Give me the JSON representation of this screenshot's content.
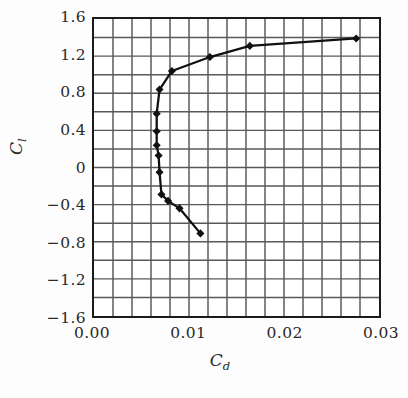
{
  "chart_data": {
    "type": "line",
    "title": "",
    "subtitle": "",
    "xlabel": "Cd",
    "xlabel_base": "C",
    "xlabel_sub": "d",
    "ylabel": "Cl",
    "ylabel_base": "C",
    "ylabel_sub": "l",
    "xlim": [
      0.0,
      0.03
    ],
    "ylim": [
      -1.6,
      1.6
    ],
    "x_major_ticks": [
      0.0,
      0.01,
      0.02,
      0.03
    ],
    "x_tick_labels": [
      "0.00",
      "0.01",
      "0.02",
      "0.03"
    ],
    "x_minor_step": 0.002,
    "y_major_ticks": [
      1.6,
      1.2,
      0.8,
      0.4,
      0,
      -0.4,
      -0.8,
      -1.2,
      -1.6
    ],
    "y_tick_labels": [
      "1.6",
      "1.2",
      "0.8",
      "0.4",
      "0",
      "−0.4",
      "−0.8",
      "−1.2",
      "−1.6"
    ],
    "y_minor_step": 0.2,
    "grid": true,
    "grid_color": "#59595b",
    "frame_color": "#1b1b1b",
    "legend": null,
    "legend_position": "none",
    "series": [
      {
        "name": "drag polar",
        "marker": "diamond",
        "marker_color": "#111111",
        "line_color": "#111111",
        "x": [
          0.0276,
          0.0164,
          0.0122,
          0.0082,
          0.0069,
          0.0066,
          0.0066,
          0.0066,
          0.0068,
          0.0069,
          0.0071,
          0.0078,
          0.009,
          0.0112
        ],
        "y": [
          1.39,
          1.31,
          1.19,
          1.04,
          0.84,
          0.58,
          0.39,
          0.24,
          0.13,
          -0.05,
          -0.29,
          -0.36,
          -0.44,
          -0.71
        ]
      }
    ]
  }
}
